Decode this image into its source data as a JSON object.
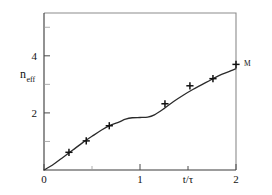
{
  "chart_data": {
    "type": "line",
    "title": "",
    "subtitle": "",
    "xlabel": "t/τ",
    "ylabel": "n_eff",
    "ylabel_main": "n",
    "ylabel_sub": "eff",
    "xlim": [
      0,
      2
    ],
    "ylim": [
      0,
      5.5
    ],
    "grid": false,
    "legend": null,
    "x_ticks": [
      0,
      0.5,
      1,
      1.5,
      2
    ],
    "x_tick_labels": [
      "0",
      "",
      "1",
      "",
      "2"
    ],
    "y_ticks": [
      1,
      2,
      3,
      4,
      5
    ],
    "y_tick_labels": [
      "",
      "2",
      "",
      "4",
      ""
    ],
    "xlabel_at_x": 1.5,
    "annotations": [
      {
        "text": "M",
        "x": 2.0,
        "y": 3.7,
        "dx": 8,
        "dy": 2
      }
    ],
    "series": [
      {
        "name": "data-points",
        "marker": "plus",
        "x": [
          0.26,
          0.44,
          0.68,
          1.26,
          1.52,
          1.76,
          2.0
        ],
        "y": [
          0.62,
          1.02,
          1.55,
          2.32,
          2.95,
          3.2,
          3.7
        ]
      },
      {
        "name": "model-curve",
        "marker": "none",
        "x": [
          0.0,
          0.1,
          0.2,
          0.3,
          0.4,
          0.5,
          0.6,
          0.7,
          0.78,
          0.85,
          0.92,
          1.0,
          1.08,
          1.15,
          1.25,
          1.35,
          1.45,
          1.55,
          1.65,
          1.75,
          1.85,
          1.95,
          2.0
        ],
        "y": [
          0.0,
          0.2,
          0.45,
          0.7,
          0.95,
          1.18,
          1.4,
          1.58,
          1.68,
          1.78,
          1.83,
          1.84,
          1.85,
          1.93,
          2.15,
          2.4,
          2.62,
          2.82,
          3.0,
          3.18,
          3.35,
          3.48,
          3.55
        ]
      }
    ]
  },
  "axes": {
    "x_axis_name": "time-axis",
    "y_axis_name": "n-eff-axis"
  }
}
